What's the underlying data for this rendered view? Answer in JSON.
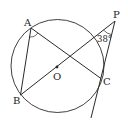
{
  "diagram": {
    "type": "geometry",
    "colors": {
      "stroke": "#2a2a2a",
      "background": "#ffffff",
      "text": "#222222"
    },
    "circle": {
      "center_label": "O"
    },
    "points": {
      "A": {
        "label": "A"
      },
      "B": {
        "label": "B"
      },
      "C": {
        "label": "C"
      },
      "O": {
        "label": "O"
      },
      "P": {
        "label": "P"
      }
    },
    "segments": [
      "AB",
      "AC",
      "BP",
      "PC (tangent, extended)"
    ],
    "angles": {
      "P": {
        "label": "38°",
        "value_deg": 38
      },
      "A": {
        "marked": true
      }
    }
  }
}
